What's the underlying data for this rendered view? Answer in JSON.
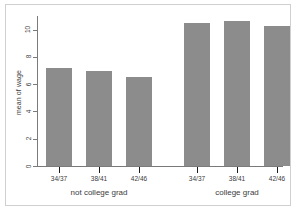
{
  "chart_data": {
    "type": "bar",
    "title": "",
    "xlabel": "",
    "ylabel": "mean of wage",
    "ylim": [
      0,
      11
    ],
    "yticks": [
      0,
      2,
      4,
      6,
      8,
      10
    ],
    "ytick_labels": [
      "0",
      "2",
      "4",
      "6",
      "8",
      "10"
    ],
    "grid": false,
    "legend": "none",
    "categories": [
      "34/37",
      "38/41",
      "42/46"
    ],
    "groups": [
      {
        "label": "not college grad",
        "categories": [
          "34/37",
          "38/41",
          "42/46"
        ],
        "values": [
          7.2,
          7.0,
          6.5
        ]
      },
      {
        "label": "college grad",
        "categories": [
          "34/37",
          "38/41",
          "42/46"
        ],
        "values": [
          10.5,
          10.6,
          10.3
        ]
      }
    ],
    "bar_color": "#8c8c8c",
    "axis_color": "#7a7a7a",
    "background": "#ffffff"
  },
  "bars": [
    {
      "label": "34/37",
      "group": "not college grad",
      "value": 7.2
    },
    {
      "label": "38/41",
      "group": "not college grad",
      "value": 7.0
    },
    {
      "label": "42/46",
      "group": "not college grad",
      "value": 6.5
    },
    {
      "label": "34/37",
      "group": "college grad",
      "value": 10.5
    },
    {
      "label": "38/41",
      "group": "college grad",
      "value": 10.6
    },
    {
      "label": "42/46",
      "group": "college grad",
      "value": 10.3
    }
  ],
  "axis": {
    "y_label": "mean of wage",
    "y_ticks": [
      "0",
      "2",
      "4",
      "6",
      "8",
      "10"
    ]
  },
  "x_labels": [
    "34/37",
    "38/41",
    "42/46",
    "34/37",
    "38/41",
    "42/46"
  ],
  "group_labels": [
    "not college grad",
    "college grad"
  ]
}
